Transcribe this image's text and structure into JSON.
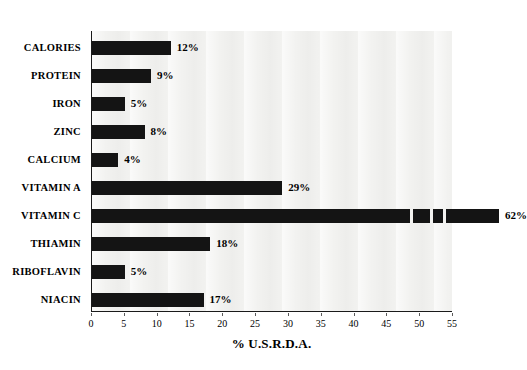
{
  "chart_data": {
    "type": "bar",
    "orientation": "horizontal",
    "title": "",
    "xlabel": "% U.S.R.D.A.",
    "ylabel": "",
    "xlim": [
      0,
      55
    ],
    "xticks": [
      0,
      5,
      10,
      15,
      20,
      25,
      30,
      35,
      40,
      45,
      50,
      55
    ],
    "xtick_labels": [
      "0",
      "5",
      "10",
      "15",
      "20",
      "25",
      "30",
      "35",
      "40",
      "45",
      "50",
      "55"
    ],
    "grid": false,
    "legend": null,
    "categories": [
      "CALORIES",
      "PROTEIN",
      "IRON",
      "ZINC",
      "CALCIUM",
      "VITAMIN A",
      "VITAMIN C",
      "THIAMIN",
      "RIBOFLAVIN",
      "NIACIN"
    ],
    "values": [
      12,
      9,
      5,
      8,
      4,
      29,
      62,
      18,
      5,
      17
    ],
    "data_labels": [
      "12%",
      "9%",
      "5%",
      "8%",
      "4%",
      "29%",
      "62%",
      "18%",
      "5%",
      "17%"
    ],
    "bar_color": "#141414",
    "plot_background": "#f2f2f0",
    "axis_color": "#1a1a1a",
    "note": "The 62% Vitamin C bar extends beyond the 55 axis maximum and shows white scan gaps near its end."
  }
}
